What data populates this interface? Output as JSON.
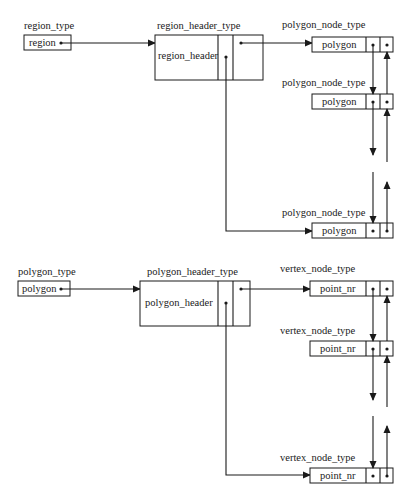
{
  "diagram": {
    "region_section": {
      "region_type": {
        "type_label": "region_type",
        "field": "region"
      },
      "region_header_type": {
        "type_label": "region_header_type",
        "field": "region_header"
      },
      "nodes": [
        {
          "type_label": "polygon_node_type",
          "field": "polygon"
        },
        {
          "type_label": "polygon_node_type",
          "field": "polygon"
        },
        {
          "type_label": "polygon_node_type",
          "field": "polygon"
        }
      ]
    },
    "polygon_section": {
      "polygon_type": {
        "type_label": "polygon_type",
        "field": "polygon"
      },
      "polygon_header_type": {
        "type_label": "polygon_header_type",
        "field": "polygon_header"
      },
      "nodes": [
        {
          "type_label": "vertex_node_type",
          "field": "point_nr"
        },
        {
          "type_label": "vertex_node_type",
          "field": "point_nr"
        },
        {
          "type_label": "vertex_node_type",
          "field": "point_nr"
        }
      ]
    }
  }
}
